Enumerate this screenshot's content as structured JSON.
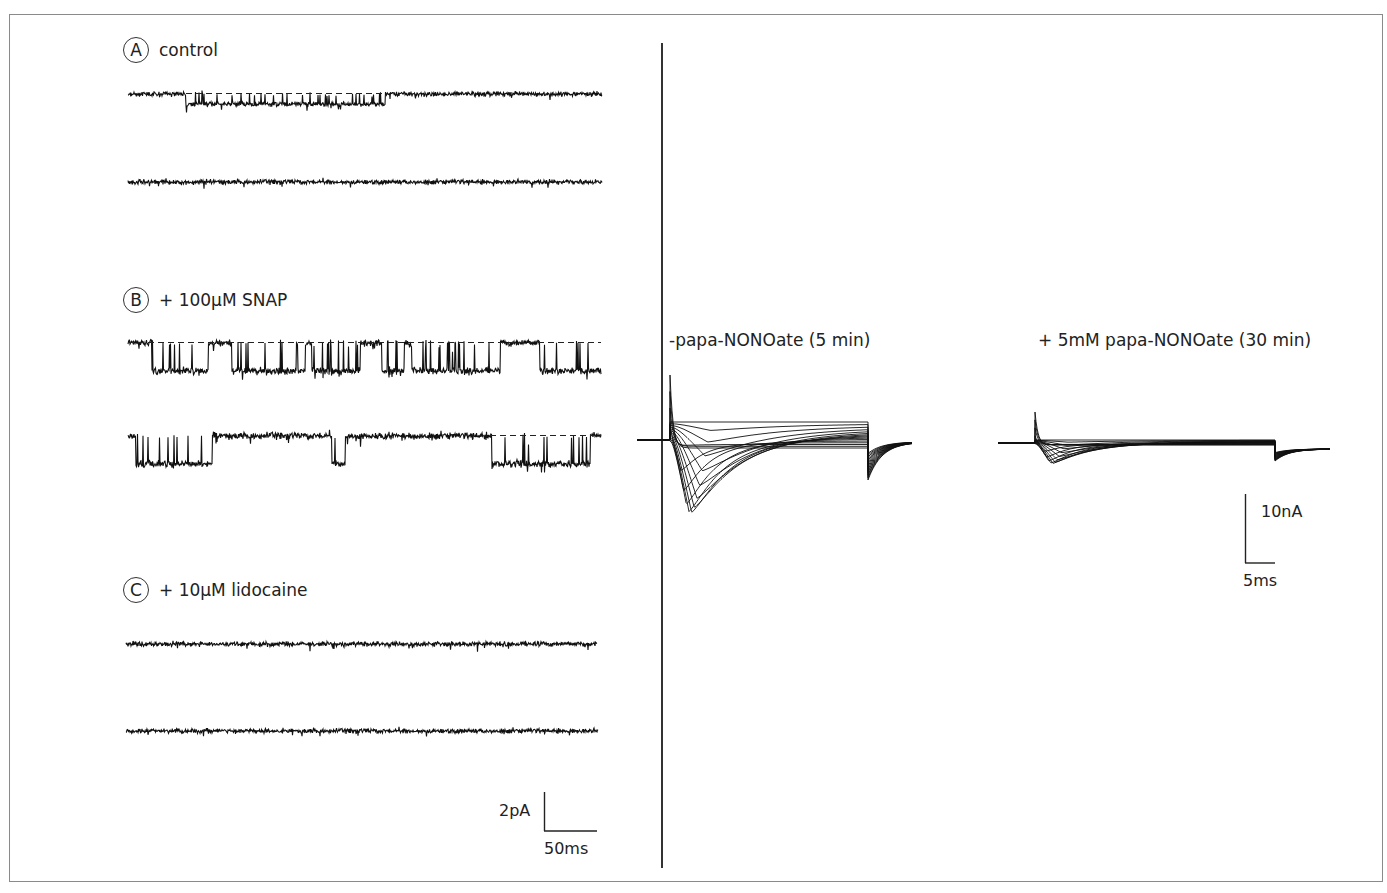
{
  "figure": {
    "panels": [
      {
        "id": "A",
        "letter": "A",
        "condition": "control"
      },
      {
        "id": "B",
        "letter": "B",
        "condition": "+ 100µM SNAP"
      },
      {
        "id": "C",
        "letter": "C",
        "condition": "+ 10µM lidocaine"
      }
    ],
    "single_channel_scale": {
      "current": "2pA",
      "time": "50ms"
    },
    "whole_cell": {
      "left_title": "-papa-NONOate (5 min)",
      "right_title": "+ 5mM papa-NONOate (30 min)",
      "scale": {
        "current": "10nA",
        "time": "5ms"
      }
    }
  },
  "chart_data": [
    {
      "type": "line",
      "title": "Single-channel recordings",
      "subplots": [
        {
          "panel": "A",
          "label": "control",
          "traces": 2,
          "description": "Mostly closed channel; brief openings (dashed line = open level) in first trace",
          "open_fraction_trace1": 0.35,
          "open_fraction_trace2": 0.0
        },
        {
          "panel": "B",
          "label": "+ 100µM SNAP",
          "traces": 2,
          "description": "Frequent prolonged channel openings (persistent Na+ current)",
          "open_fraction_trace1": 0.7,
          "open_fraction_trace2": 0.25
        },
        {
          "panel": "C",
          "label": "+ 10µM lidocaine",
          "traces": 2,
          "description": "Openings blocked; baseline noise only",
          "open_fraction_trace1": 0.0,
          "open_fraction_trace2": 0.0
        }
      ],
      "scale_bar": {
        "y": "2pA",
        "x": "50ms"
      }
    },
    {
      "type": "line",
      "title": "-papa-NONOate (5 min)",
      "description": "Family of whole-cell currents: large transient inward currents with outward capacitive peak",
      "n_sweeps": 16,
      "peak_inward_relative": 1.0,
      "scale_bar": {
        "y": "10nA",
        "x": "5ms"
      }
    },
    {
      "type": "line",
      "title": "+ 5mM papa-NONOate (30 min)",
      "description": "Family of whole-cell currents: strongly reduced transient inward currents",
      "n_sweeps": 16,
      "peak_inward_relative": 0.27,
      "scale_bar": {
        "y": "10nA",
        "x": "5ms"
      }
    }
  ]
}
